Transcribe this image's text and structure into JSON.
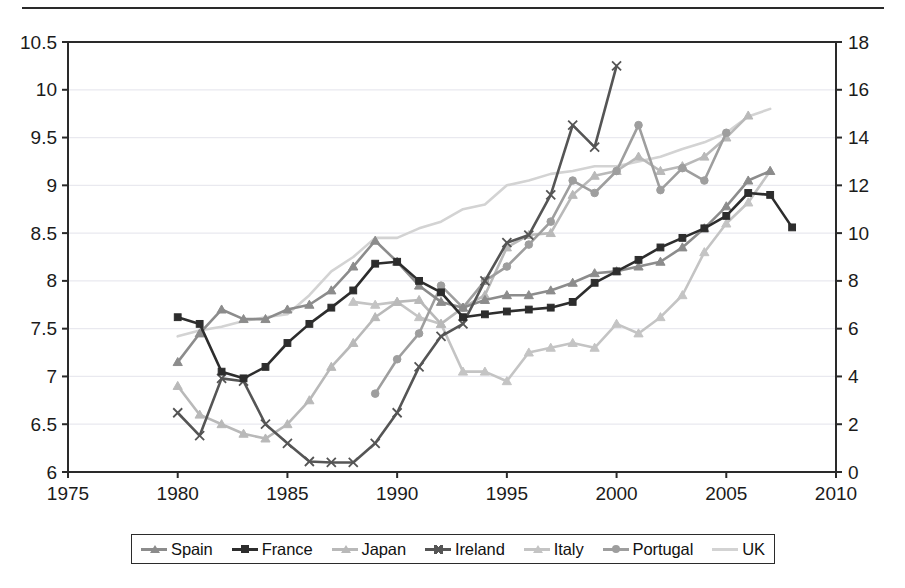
{
  "chart_data": {
    "type": "line",
    "title": "",
    "subtitle": "",
    "xlabel": "",
    "ylabel": "",
    "xlim": [
      1975,
      2010
    ],
    "xticks": [
      1975,
      1980,
      1985,
      1990,
      1995,
      2000,
      2005,
      2010
    ],
    "ylim": [
      6,
      10.5
    ],
    "yticks": [
      6,
      6.5,
      7,
      7.5,
      8,
      8.5,
      9,
      9.5,
      10,
      10.5
    ],
    "ylim_right": [
      0,
      18
    ],
    "yticks_right": [
      0,
      2,
      4,
      6,
      8,
      10,
      12,
      14,
      16,
      18
    ],
    "grid": true,
    "grid_axis": "y",
    "legend_position": "bottom",
    "series": [
      {
        "name": "Spain",
        "color": "#8c8c8c",
        "marker": "triangle",
        "axis": "left",
        "x": [
          1980,
          1981,
          1982,
          1983,
          1984,
          1985,
          1986,
          1987,
          1988,
          1989,
          1990,
          1991,
          1992,
          1993,
          1994,
          1995,
          1996,
          1997,
          1998,
          1999,
          2000,
          2001,
          2002,
          2003,
          2004,
          2005,
          2006,
          2007
        ],
        "y": [
          7.15,
          7.45,
          7.7,
          7.6,
          7.6,
          7.7,
          7.75,
          7.9,
          8.15,
          8.42,
          8.2,
          7.95,
          7.78,
          7.72,
          7.8,
          7.85,
          7.85,
          7.9,
          7.98,
          8.08,
          8.1,
          8.15,
          8.2,
          8.35,
          8.55,
          8.78,
          9.05,
          9.15
        ]
      },
      {
        "name": "France",
        "color": "#2d2d2d",
        "marker": "square",
        "axis": "left",
        "x": [
          1980,
          1981,
          1982,
          1983,
          1984,
          1985,
          1986,
          1987,
          1988,
          1989,
          1990,
          1991,
          1992,
          1993,
          1994,
          1995,
          1996,
          1997,
          1998,
          1999,
          2000,
          2001,
          2002,
          2003,
          2004,
          2005,
          2006,
          2007,
          2008
        ],
        "y": [
          7.62,
          7.55,
          7.05,
          6.98,
          7.1,
          7.35,
          7.55,
          7.72,
          7.9,
          8.18,
          8.2,
          8.0,
          7.88,
          7.62,
          7.65,
          7.68,
          7.7,
          7.72,
          7.78,
          7.98,
          8.1,
          8.22,
          8.35,
          8.45,
          8.55,
          8.68,
          8.92,
          8.9,
          8.56
        ]
      },
      {
        "name": "Japan",
        "color": "#b9b9b9",
        "marker": "triangle",
        "axis": "left",
        "x": [
          1980,
          1981,
          1982,
          1983,
          1984,
          1985,
          1986,
          1987,
          1988,
          1989,
          1990,
          1991,
          1992,
          1993,
          1994,
          1995,
          1996,
          1997,
          1998,
          1999,
          2000,
          2001,
          2002,
          2003,
          2004,
          2005,
          2006
        ],
        "y": [
          6.9,
          6.6,
          6.5,
          6.4,
          6.35,
          6.5,
          6.75,
          7.1,
          7.35,
          7.62,
          7.78,
          7.8,
          7.55,
          7.72,
          7.85,
          8.35,
          8.48,
          8.5,
          8.9,
          9.1,
          9.15,
          9.3,
          9.15,
          9.2,
          9.3,
          9.5,
          9.73
        ]
      },
      {
        "name": "Ireland",
        "color": "#555555",
        "marker": "x",
        "axis": "left",
        "x": [
          1980,
          1981,
          1982,
          1983,
          1984,
          1985,
          1986,
          1987,
          1988,
          1989,
          1990,
          1991,
          1992,
          1993,
          1994,
          1995,
          1996,
          1997,
          1998,
          1999,
          2000
        ],
        "y": [
          6.62,
          6.38,
          6.98,
          6.95,
          6.5,
          6.3,
          6.11,
          6.1,
          6.1,
          6.3,
          6.62,
          7.1,
          7.42,
          7.55,
          8.0,
          8.4,
          8.48,
          8.9,
          9.63,
          9.4,
          10.25
        ]
      },
      {
        "name": "Italy",
        "color": "#c4c4c4",
        "marker": "triangle",
        "axis": "left",
        "x": [
          1988,
          1989,
          1990,
          1991,
          1992,
          1993,
          1994,
          1995,
          1996,
          1997,
          1998,
          1999,
          2000,
          2001,
          2002,
          2003,
          2004,
          2005,
          2006,
          2007
        ],
        "y": [
          7.78,
          7.75,
          7.78,
          7.62,
          7.55,
          7.05,
          7.05,
          6.95,
          7.25,
          7.3,
          7.35,
          7.3,
          7.55,
          7.45,
          7.62,
          7.85,
          8.3,
          8.6,
          8.82,
          9.15
        ]
      },
      {
        "name": "Portugal",
        "color": "#9e9e9e",
        "marker": "circle",
        "axis": "left",
        "x": [
          1989,
          1990,
          1991,
          1992,
          1993,
          1994,
          1995,
          1996,
          1997,
          1998,
          1999,
          2000,
          2001,
          2002,
          2003,
          2004,
          2005
        ],
        "y": [
          6.82,
          7.18,
          7.45,
          7.95,
          7.72,
          8.0,
          8.15,
          8.38,
          8.62,
          9.05,
          8.92,
          9.15,
          9.63,
          8.95,
          9.18,
          9.05,
          9.55
        ]
      },
      {
        "name": "UK",
        "color": "#d3d3d3",
        "marker": "none",
        "axis": "left",
        "x": [
          1980,
          1981,
          1982,
          1983,
          1984,
          1985,
          1986,
          1987,
          1988,
          1989,
          1990,
          1991,
          1992,
          1993,
          1994,
          1995,
          1996,
          1997,
          1998,
          1999,
          2000,
          2001,
          2002,
          2003,
          2004,
          2005,
          2006,
          2007
        ],
        "y": [
          7.42,
          7.48,
          7.52,
          7.58,
          7.62,
          7.65,
          7.85,
          8.1,
          8.25,
          8.45,
          8.45,
          8.55,
          8.62,
          8.75,
          8.8,
          9.0,
          9.05,
          9.12,
          9.15,
          9.2,
          9.2,
          9.25,
          9.3,
          9.38,
          9.45,
          9.55,
          9.72,
          9.8
        ]
      }
    ]
  },
  "legend": {
    "items": [
      {
        "label": "Spain",
        "color": "#8c8c8c",
        "marker": "triangle"
      },
      {
        "label": "France",
        "color": "#2d2d2d",
        "marker": "square"
      },
      {
        "label": "Japan",
        "color": "#b9b9b9",
        "marker": "triangle"
      },
      {
        "label": "Ireland",
        "color": "#555555",
        "marker": "x"
      },
      {
        "label": "Italy",
        "color": "#c4c4c4",
        "marker": "triangle"
      },
      {
        "label": "Portugal",
        "color": "#9e9e9e",
        "marker": "circle"
      },
      {
        "label": "UK",
        "color": "#d3d3d3",
        "marker": "none"
      }
    ]
  },
  "axes": {
    "left_ticks": [
      "6",
      "6.5",
      "7",
      "7.5",
      "8",
      "8.5",
      "9",
      "9.5",
      "10",
      "10.5"
    ],
    "right_ticks": [
      "0",
      "2",
      "4",
      "6",
      "8",
      "10",
      "12",
      "14",
      "16",
      "18"
    ],
    "x_ticks": [
      "1975",
      "1980",
      "1985",
      "1990",
      "1995",
      "2000",
      "2005",
      "2010"
    ]
  },
  "style": {
    "frame_color": "#2a2a2a",
    "grid_color": "#e9e9ef",
    "background": "#ffffff"
  }
}
